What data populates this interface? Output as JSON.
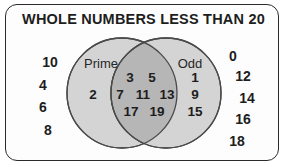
{
  "diagram": {
    "title": "WHOLE NUMBERS LESS THAN 20",
    "type": "venn-diagram",
    "universe_label": "WHOLE NUMBERS LESS THAN 20",
    "sets": [
      {
        "name": "Prime",
        "label": "Prime"
      },
      {
        "name": "Odd",
        "label": "Odd"
      }
    ],
    "regions": {
      "prime_only": {
        "label": "Prime",
        "values": [
          "2"
        ]
      },
      "intersection": {
        "rows": [
          [
            "3",
            "5"
          ],
          [
            "7",
            "11",
            "13"
          ],
          [
            "17",
            "19"
          ]
        ],
        "values": [
          "3",
          "5",
          "7",
          "11",
          "13",
          "17",
          "19"
        ]
      },
      "odd_only": {
        "label": "Odd",
        "values": [
          "1",
          "9",
          "15"
        ]
      },
      "outside_left": {
        "values": [
          "10",
          "4",
          "6",
          "8"
        ]
      },
      "outside_right": {
        "values": [
          "0",
          "12",
          "14",
          "16",
          "18"
        ]
      }
    },
    "colors": {
      "border": "#2b2b2b",
      "circle_fill": "#d4d4d4",
      "intersection_fill": "#b6b6b6",
      "circle_stroke": "#4a4a4a",
      "text": "#1d1d1d",
      "background": "#fdfdfd"
    }
  }
}
